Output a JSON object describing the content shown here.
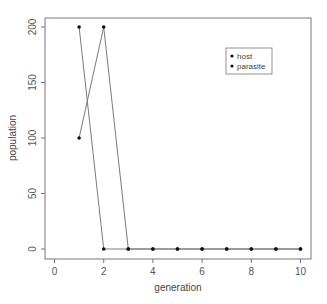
{
  "chart_data": {
    "type": "line",
    "title": "",
    "xlabel": "generation",
    "ylabel": "population",
    "xlim": [
      0,
      10
    ],
    "ylim": [
      0,
      200
    ],
    "x_ticks": [
      "0",
      "2",
      "4",
      "6",
      "8",
      "10"
    ],
    "y_ticks": [
      "0",
      "50",
      "100",
      "150",
      "200"
    ],
    "grid": false,
    "legend_position": "top-right (inside)",
    "x": [
      1,
      2,
      3,
      4,
      5,
      6,
      7,
      8,
      9,
      10
    ],
    "series": [
      {
        "name": "host",
        "values": [
          200,
          0,
          0,
          0,
          0,
          0,
          0,
          0,
          0,
          0
        ]
      },
      {
        "name": "parasite",
        "values": [
          100,
          200,
          0,
          0,
          0,
          0,
          0,
          0,
          0,
          0
        ]
      }
    ]
  },
  "legend": {
    "items": [
      "host",
      "parasite"
    ]
  },
  "colors": {
    "line": "#7a7a7a",
    "marker": "#111111",
    "axis": "#666666"
  }
}
